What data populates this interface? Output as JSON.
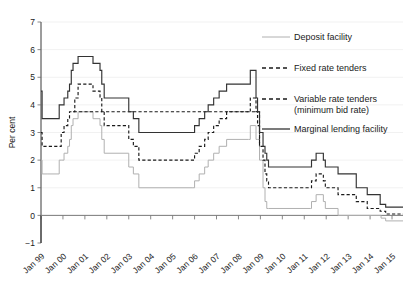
{
  "chart_data": {
    "type": "line",
    "title": "",
    "xlabel": "",
    "ylabel": "Per cent",
    "ylim": [
      -1,
      7
    ],
    "yticks": [
      -1,
      0,
      1,
      2,
      3,
      4,
      5,
      6,
      7
    ],
    "grid": true,
    "legend_position": "right",
    "xlim": [
      "Jan 99",
      "Jan 15"
    ],
    "categories": [
      "Jan 99",
      "Jan 00",
      "Jan 01",
      "Jan 02",
      "Jan 03",
      "Jan 04",
      "Jan 05",
      "Jan 06",
      "Jan 07",
      "Jan 08",
      "Jan 09",
      "Jan 10",
      "Jan 11",
      "Jan 12",
      "Jan 13",
      "Jan 14",
      "Jan 15"
    ],
    "series": [
      {
        "name": "Marginal lending facility",
        "style": "solid",
        "color": "#333333",
        "points": [
          [
            1999.0,
            4.5
          ],
          [
            1999.04,
            4.5
          ],
          [
            1999.05,
            3.5
          ],
          [
            1999.28,
            3.5
          ],
          [
            1999.83,
            4.0
          ],
          [
            1999.92,
            4.0
          ],
          [
            2000.05,
            4.25
          ],
          [
            2000.22,
            4.5
          ],
          [
            2000.3,
            4.75
          ],
          [
            2000.38,
            5.25
          ],
          [
            2000.46,
            5.5
          ],
          [
            2000.69,
            5.75
          ],
          [
            2001.33,
            5.75
          ],
          [
            2001.37,
            5.5
          ],
          [
            2001.69,
            5.25
          ],
          [
            2001.77,
            4.75
          ],
          [
            2001.88,
            4.25
          ],
          [
            2002.97,
            4.25
          ],
          [
            2003.0,
            3.75
          ],
          [
            2003.21,
            3.5
          ],
          [
            2003.46,
            3.0
          ],
          [
            2005.92,
            3.0
          ],
          [
            2006.0,
            3.25
          ],
          [
            2006.21,
            3.5
          ],
          [
            2006.46,
            3.75
          ],
          [
            2006.62,
            4.0
          ],
          [
            2006.87,
            4.25
          ],
          [
            2007.12,
            4.5
          ],
          [
            2007.46,
            4.75
          ],
          [
            2008.46,
            4.75
          ],
          [
            2008.54,
            5.25
          ],
          [
            2008.77,
            5.25
          ],
          [
            2008.8,
            4.25
          ],
          [
            2008.87,
            3.75
          ],
          [
            2008.96,
            3.0
          ],
          [
            2009.12,
            2.5
          ],
          [
            2009.21,
            2.25
          ],
          [
            2009.29,
            2.0
          ],
          [
            2009.37,
            1.75
          ],
          [
            2011.29,
            1.75
          ],
          [
            2011.33,
            2.0
          ],
          [
            2011.54,
            2.25
          ],
          [
            2011.87,
            2.0
          ],
          [
            2011.96,
            1.75
          ],
          [
            2012.54,
            1.5
          ],
          [
            2013.37,
            1.0
          ],
          [
            2013.87,
            0.75
          ],
          [
            2014.46,
            0.4
          ],
          [
            2014.71,
            0.3
          ],
          [
            2015.5,
            0.3
          ]
        ]
      },
      {
        "name": "Variable rate tenders (minimum bid rate)",
        "style": "dashed",
        "color": "#1a1a1a",
        "points": [
          [
            2000.46,
            3.75
          ],
          [
            2000.54,
            4.25
          ],
          [
            2000.69,
            4.75
          ],
          [
            2001.33,
            4.75
          ],
          [
            2001.37,
            4.5
          ],
          [
            2001.69,
            4.25
          ],
          [
            2001.77,
            3.75
          ],
          [
            2001.88,
            3.25
          ],
          [
            2002.97,
            3.25
          ],
          [
            2003.0,
            2.75
          ],
          [
            2003.21,
            2.5
          ],
          [
            2003.46,
            2.0
          ],
          [
            2005.92,
            2.0
          ],
          [
            2006.0,
            2.25
          ],
          [
            2006.21,
            2.5
          ],
          [
            2006.46,
            2.75
          ],
          [
            2006.62,
            3.0
          ],
          [
            2006.87,
            3.25
          ],
          [
            2007.12,
            3.5
          ],
          [
            2007.46,
            3.75
          ],
          [
            2008.46,
            3.75
          ],
          [
            2008.54,
            4.25
          ],
          [
            2008.77,
            4.25
          ],
          [
            2008.8,
            3.75
          ],
          [
            2008.87,
            3.25
          ],
          [
            2008.96,
            2.5
          ]
        ]
      },
      {
        "name": "Fixed rate tenders",
        "style": "dashed",
        "color": "#1a1a1a",
        "points": [
          [
            1999.0,
            3.0
          ],
          [
            1999.04,
            3.0
          ],
          [
            1999.05,
            2.5
          ],
          [
            1999.28,
            2.5
          ],
          [
            1999.83,
            2.5
          ],
          [
            1999.92,
            3.0
          ],
          [
            2000.05,
            3.25
          ],
          [
            2000.22,
            3.5
          ],
          [
            2000.3,
            3.75
          ],
          [
            2000.46,
            3.75
          ],
          [
            2008.96,
            2.5
          ],
          [
            2009.12,
            2.0
          ],
          [
            2009.21,
            1.5
          ],
          [
            2009.29,
            1.25
          ],
          [
            2009.37,
            1.0
          ],
          [
            2011.29,
            1.0
          ],
          [
            2011.33,
            1.25
          ],
          [
            2011.54,
            1.5
          ],
          [
            2011.87,
            1.25
          ],
          [
            2011.96,
            1.0
          ],
          [
            2012.54,
            0.75
          ],
          [
            2013.37,
            0.5
          ],
          [
            2013.87,
            0.25
          ],
          [
            2014.46,
            0.15
          ],
          [
            2014.71,
            0.05
          ],
          [
            2015.5,
            0.05
          ]
        ]
      },
      {
        "name": "Deposit facility",
        "style": "solid",
        "color": "#b0b0b0",
        "points": [
          [
            1999.0,
            2.0
          ],
          [
            1999.04,
            2.0
          ],
          [
            1999.05,
            1.5
          ],
          [
            1999.28,
            1.5
          ],
          [
            1999.83,
            2.0
          ],
          [
            1999.92,
            2.0
          ],
          [
            2000.05,
            2.25
          ],
          [
            2000.22,
            2.5
          ],
          [
            2000.3,
            2.75
          ],
          [
            2000.38,
            3.25
          ],
          [
            2000.46,
            3.5
          ],
          [
            2000.69,
            3.75
          ],
          [
            2001.33,
            3.75
          ],
          [
            2001.37,
            3.5
          ],
          [
            2001.69,
            3.25
          ],
          [
            2001.77,
            2.75
          ],
          [
            2001.88,
            2.25
          ],
          [
            2002.97,
            2.25
          ],
          [
            2003.0,
            1.75
          ],
          [
            2003.21,
            1.5
          ],
          [
            2003.46,
            1.0
          ],
          [
            2005.92,
            1.0
          ],
          [
            2006.0,
            1.25
          ],
          [
            2006.21,
            1.5
          ],
          [
            2006.46,
            1.75
          ],
          [
            2006.62,
            2.0
          ],
          [
            2006.87,
            2.25
          ],
          [
            2007.12,
            2.5
          ],
          [
            2007.46,
            2.75
          ],
          [
            2008.46,
            2.75
          ],
          [
            2008.54,
            3.25
          ],
          [
            2008.77,
            3.25
          ],
          [
            2008.8,
            2.75
          ],
          [
            2008.87,
            2.75
          ],
          [
            2008.96,
            2.0
          ],
          [
            2009.12,
            1.0
          ],
          [
            2009.21,
            0.5
          ],
          [
            2009.29,
            0.25
          ],
          [
            2009.37,
            0.25
          ],
          [
            2011.29,
            0.25
          ],
          [
            2011.33,
            0.5
          ],
          [
            2011.54,
            0.75
          ],
          [
            2011.87,
            0.5
          ],
          [
            2011.96,
            0.25
          ],
          [
            2012.54,
            0.0
          ],
          [
            2014.46,
            0.0
          ],
          [
            2014.5,
            -0.1
          ],
          [
            2014.71,
            -0.2
          ],
          [
            2015.5,
            -0.2
          ]
        ]
      }
    ],
    "legend": [
      {
        "label": "Deposit facility",
        "style": "solid",
        "color": "#b0b0b0"
      },
      {
        "label": "Fixed rate tenders",
        "style": "dashed",
        "color": "#1a1a1a"
      },
      {
        "label": "Variable rate tenders",
        "label2": "(minimum bid rate)",
        "style": "dashed",
        "color": "#1a1a1a"
      },
      {
        "label": "Marginal lending facility",
        "style": "solid",
        "color": "#333333"
      }
    ]
  }
}
